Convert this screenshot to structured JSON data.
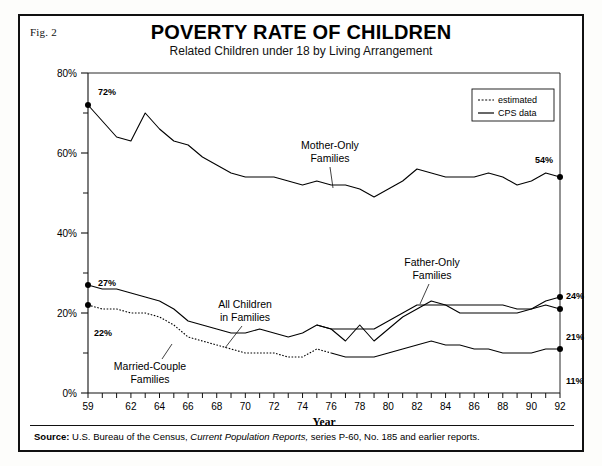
{
  "figure": {
    "number_label": "Fig. 2",
    "title": "POVERTY RATE OF CHILDREN",
    "subtitle": "Related Children under 18 by Living Arrangement",
    "source_label": "Source:",
    "source_text_1": "U.S. Bureau of the Census,",
    "source_italic": "Current Population Reports,",
    "source_text_2": "series P-60, No. 185 and earlier reports."
  },
  "legend": {
    "position": "top-right",
    "items": [
      {
        "label": "estimated",
        "style": "dotted",
        "color": "#000000"
      },
      {
        "label": "CPS data",
        "style": "solid",
        "color": "#000000"
      }
    ]
  },
  "annotations": {
    "mother_only": {
      "line1": "Mother-Only",
      "line2": "Families"
    },
    "all_children": {
      "line1": "All  Children",
      "line2": "in Families"
    },
    "father_only": {
      "line1": "Father-Only",
      "line2": "Families"
    },
    "married_couple": {
      "line1": "Married-Couple",
      "line2": "Families"
    }
  },
  "endpoint_labels": {
    "mother_only_start": "72%",
    "mother_only_end": "54%",
    "all_children_start": "27%",
    "all_children_end": "21%",
    "father_only_end": "24%",
    "married_couple_start": "22%",
    "married_couple_end": "11%"
  },
  "chart_data": {
    "type": "line",
    "title": "POVERTY RATE OF CHILDREN",
    "subtitle": "Related Children under 18 by Living Arrangement",
    "xlabel": "Year",
    "ylabel": "",
    "xlim": [
      59,
      92
    ],
    "ylim": [
      0,
      80
    ],
    "yticks": [
      0,
      20,
      40,
      60,
      80
    ],
    "ytick_labels": [
      "0%",
      "20%",
      "40%",
      "60%",
      "80%"
    ],
    "yminor_ticks": [
      10,
      30,
      50,
      70
    ],
    "xticks": [
      59,
      60,
      61,
      62,
      63,
      64,
      65,
      66,
      67,
      68,
      69,
      70,
      71,
      72,
      73,
      74,
      75,
      76,
      77,
      78,
      79,
      80,
      81,
      82,
      83,
      84,
      85,
      86,
      87,
      88,
      89,
      90,
      91,
      92
    ],
    "xtick_labels_shown": [
      "59",
      "62",
      "64",
      "66",
      "68",
      "70",
      "72",
      "74",
      "76",
      "78",
      "80",
      "82",
      "84",
      "86",
      "88",
      "90",
      "92"
    ],
    "grid": false,
    "x": [
      59,
      60,
      61,
      62,
      63,
      64,
      65,
      66,
      67,
      68,
      69,
      70,
      71,
      72,
      73,
      74,
      75,
      76,
      77,
      78,
      79,
      80,
      81,
      82,
      83,
      84,
      85,
      86,
      87,
      88,
      89,
      90,
      91,
      92
    ],
    "series": [
      {
        "name": "Mother-Only Families",
        "style": "solid",
        "marker_endpoints": true,
        "values": [
          72,
          68,
          64,
          63,
          70,
          66,
          63,
          62,
          59,
          57,
          55,
          54,
          54,
          54,
          53,
          52,
          53,
          52,
          52,
          51,
          49,
          51,
          53,
          56,
          55,
          54,
          54,
          54,
          55,
          54,
          52,
          53,
          55,
          54
        ]
      },
      {
        "name": "Father-Only Families",
        "style": "solid",
        "marker_endpoints": true,
        "values": [
          null,
          null,
          null,
          null,
          null,
          null,
          null,
          null,
          null,
          null,
          null,
          null,
          null,
          null,
          null,
          null,
          17,
          16,
          13,
          17,
          13,
          16,
          19,
          21,
          23,
          22,
          22,
          22,
          22,
          22,
          21,
          21,
          23,
          24
        ]
      },
      {
        "name": "All Children in Families",
        "style": "solid",
        "marker_endpoints": true,
        "values": [
          27,
          26,
          26,
          25,
          24,
          23,
          21,
          18,
          17,
          16,
          15,
          15,
          16,
          15,
          14,
          15,
          17,
          16,
          16,
          16,
          16,
          18,
          20,
          22,
          22,
          22,
          20,
          20,
          20,
          20,
          20,
          21,
          22,
          21
        ]
      },
      {
        "name": "Married-Couple Families",
        "style": "dotted-then-solid",
        "estimated_until": 76,
        "marker_endpoints": true,
        "values": [
          22,
          21,
          21,
          20,
          20,
          19,
          17,
          14,
          13,
          12,
          11,
          10,
          10,
          10,
          9,
          9,
          11,
          10,
          9,
          9,
          9,
          10,
          11,
          12,
          13,
          12,
          12,
          11,
          11,
          10,
          10,
          10,
          11,
          11
        ]
      }
    ]
  }
}
